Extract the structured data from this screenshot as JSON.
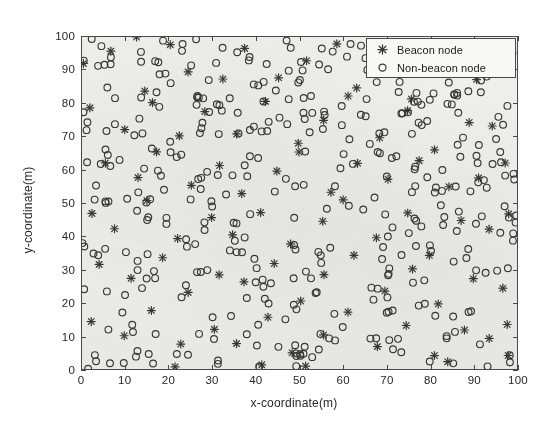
{
  "chart_data": {
    "type": "scatter",
    "title": "",
    "xlabel": "x-coordinate(m)",
    "ylabel": "y-coordinate(m)",
    "xlim": [
      0,
      100
    ],
    "ylim": [
      0,
      100
    ],
    "xticks": [
      0,
      10,
      20,
      30,
      40,
      50,
      60,
      70,
      80,
      90,
      100
    ],
    "yticks": [
      0,
      10,
      20,
      30,
      40,
      50,
      60,
      70,
      80,
      90,
      100
    ],
    "grid": false,
    "legend_position": "top-right",
    "series": [
      {
        "name": "Beacon node",
        "marker": "star",
        "color": "#3a3a3a",
        "count": 100,
        "points": [
          [
            1.2,
            92.8
          ],
          [
            6.1,
            96.3
          ],
          [
            13.4,
            84.2
          ],
          [
            19.8,
            97.1
          ],
          [
            24.3,
            90.5
          ],
          [
            31.6,
            88.4
          ],
          [
            38.2,
            95.6
          ],
          [
            45.1,
            86.9
          ],
          [
            52.7,
            93.2
          ],
          [
            58.4,
            99.1
          ],
          [
            63.9,
            85.7
          ],
          [
            70.2,
            91.4
          ],
          [
            76.8,
            82.3
          ],
          [
            83.1,
            94.8
          ],
          [
            89.6,
            87.2
          ],
          [
            96.4,
            92.1
          ],
          [
            2.9,
            78.4
          ],
          [
            9.7,
            73.1
          ],
          [
            15.2,
            80.6
          ],
          [
            22.8,
            69.3
          ],
          [
            29.4,
            76.8
          ],
          [
            35.9,
            71.2
          ],
          [
            42.3,
            79.5
          ],
          [
            48.6,
            68.4
          ],
          [
            55.1,
            74.9
          ],
          [
            61.7,
            81.3
          ],
          [
            68.2,
            70.6
          ],
          [
            74.5,
            77.8
          ],
          [
            81.3,
            66.2
          ],
          [
            87.9,
            75.4
          ],
          [
            94.2,
            72.7
          ],
          [
            5.4,
            62.1
          ],
          [
            11.8,
            58.3
          ],
          [
            18.3,
            64.7
          ],
          [
            25.1,
            55.9
          ],
          [
            31.8,
            61.4
          ],
          [
            37.2,
            53.8
          ],
          [
            44.6,
            59.2
          ],
          [
            50.9,
            65.1
          ],
          [
            57.3,
            52.6
          ],
          [
            64.1,
            60.8
          ],
          [
            70.8,
            56.3
          ],
          [
            77.2,
            63.9
          ],
          [
            84.6,
            54.1
          ],
          [
            91.2,
            58.7
          ],
          [
            97.8,
            61.2
          ],
          [
            1.8,
            47.3
          ],
          [
            8.6,
            42.8
          ],
          [
            14.9,
            49.6
          ],
          [
            21.4,
            38.2
          ],
          [
            28.7,
            45.1
          ],
          [
            34.2,
            40.7
          ],
          [
            41.8,
            48.3
          ],
          [
            47.9,
            36.9
          ],
          [
            54.3,
            43.5
          ],
          [
            60.8,
            50.2
          ],
          [
            67.4,
            39.1
          ],
          [
            73.9,
            46.8
          ],
          [
            80.2,
            35.4
          ],
          [
            86.7,
            44.2
          ],
          [
            93.4,
            41.6
          ],
          [
            99.1,
            47.9
          ],
          [
            4.2,
            31.8
          ],
          [
            10.9,
            27.4
          ],
          [
            17.6,
            33.9
          ],
          [
            23.8,
            22.7
          ],
          [
            30.4,
            29.3
          ],
          [
            36.8,
            25.1
          ],
          [
            43.2,
            32.6
          ],
          [
            49.7,
            20.8
          ],
          [
            56.2,
            28.4
          ],
          [
            62.9,
            34.2
          ],
          [
            69.3,
            23.6
          ],
          [
            75.8,
            30.9
          ],
          [
            82.4,
            19.7
          ],
          [
            88.9,
            27.2
          ],
          [
            95.6,
            24.8
          ],
          [
            2.4,
            14.6
          ],
          [
            9.1,
            9.2
          ],
          [
            16.3,
            16.8
          ],
          [
            22.1,
            6.4
          ],
          [
            29.8,
            12.9
          ],
          [
            35.4,
            8.1
          ],
          [
            42.7,
            15.3
          ],
          [
            48.2,
            4.7
          ],
          [
            55.6,
            11.2
          ],
          [
            61.3,
            17.6
          ],
          [
            68.7,
            7.3
          ],
          [
            74.2,
            13.8
          ],
          [
            80.9,
            3.2
          ],
          [
            87.4,
            10.6
          ],
          [
            94.8,
            8.4
          ],
          [
            98.2,
            14.1
          ],
          [
            12.7,
            99.2
          ],
          [
            40.3,
            2.1
          ],
          [
            66.1,
            96.8
          ],
          [
            85.2,
            1.4
          ],
          [
            52.1,
            1.8
          ],
          [
            20.6,
            1.1
          ],
          [
            97.1,
            3.6
          ]
        ]
      },
      {
        "name": "Non-beacon node",
        "marker": "circle",
        "color": "#3a3a3a",
        "count": 400,
        "note": "positions generated uniformly at random over the 100x100 m field"
      }
    ]
  },
  "legend": {
    "items": [
      {
        "label": "Beacon node",
        "marker": "star-icon"
      },
      {
        "label": "Non-beacon node",
        "marker": "circle-icon"
      }
    ]
  },
  "axes": {
    "x_title": "x-coordinate(m)",
    "y_title": "y-coordinate(m)",
    "x_tick_labels": [
      "0",
      "10",
      "20",
      "30",
      "40",
      "50",
      "60",
      "70",
      "80",
      "90",
      "100"
    ],
    "y_tick_labels": [
      "0",
      "10",
      "20",
      "30",
      "40",
      "50",
      "60",
      "70",
      "80",
      "90",
      "100"
    ]
  },
  "style": {
    "axis_color": "#4a4a4a",
    "marker_color": "#3a3a3a",
    "plot_background": "#f0f0ee",
    "page_background": "#ffffff"
  }
}
